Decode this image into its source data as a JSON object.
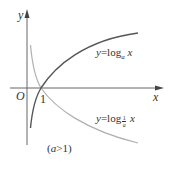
{
  "chart_data": {
    "type": "line",
    "title": "",
    "xlabel": "x",
    "ylabel": "y",
    "origin_label": "O",
    "x_tick_labels": [
      "1"
    ],
    "annotation": "(a>1)",
    "grid": false,
    "legend_position": "inline",
    "series": [
      {
        "name": "y=log_a x",
        "label_prefix": "y=log",
        "label_subscript": "a",
        "label_suffix": "x",
        "color": "#555555",
        "trend": "increasing",
        "passes_through": [
          1,
          0
        ]
      },
      {
        "name": "y=log_{1/a} x",
        "label_prefix": "y=log",
        "label_subscript_num": "1",
        "label_subscript_den": "a",
        "label_suffix": "x",
        "color": "#b0b0b0",
        "trend": "decreasing",
        "passes_through": [
          1,
          0
        ]
      }
    ]
  },
  "colors": {
    "axis": "#666666",
    "curve_log_a": "#555555",
    "curve_log_inv_a": "#b0b0b0",
    "text": "#333333"
  }
}
